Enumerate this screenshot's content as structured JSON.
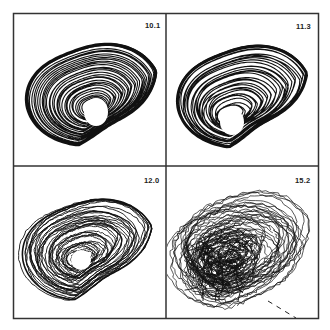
{
  "figure": {
    "type": "phase-portrait-grid",
    "layout": {
      "rows": 2,
      "cols": 2
    },
    "frame_color": "#333333",
    "trace_color": "#111111",
    "background": "#ffffff",
    "panels": [
      {
        "position": "top-left",
        "label": "10.1",
        "regime": "dense banded spiral with central hole",
        "row": 0,
        "col": 0
      },
      {
        "position": "top-right",
        "label": "11.3",
        "regime": "banded spiral with folded sheet, central hole",
        "row": 0,
        "col": 1
      },
      {
        "position": "bottom-left",
        "label": "12.0",
        "regime": "irregular spiral, partially filled hole",
        "row": 1,
        "col": 0
      },
      {
        "position": "bottom-right",
        "label": "15.2",
        "regime": "chaotic tangled trajectories with dashed tail",
        "row": 1,
        "col": 1
      }
    ]
  },
  "chart_data": {
    "type": "line",
    "title": "",
    "xlabel": "",
    "ylabel": "",
    "grid": false,
    "panels": [
      {
        "label": "10.1",
        "description": "closed-loop attractor, tight banding"
      },
      {
        "label": "11.3",
        "description": "closed-loop attractor with fold"
      },
      {
        "label": "12.0",
        "description": "broadened attractor"
      },
      {
        "label": "15.2",
        "description": "fully chaotic attractor"
      }
    ]
  }
}
